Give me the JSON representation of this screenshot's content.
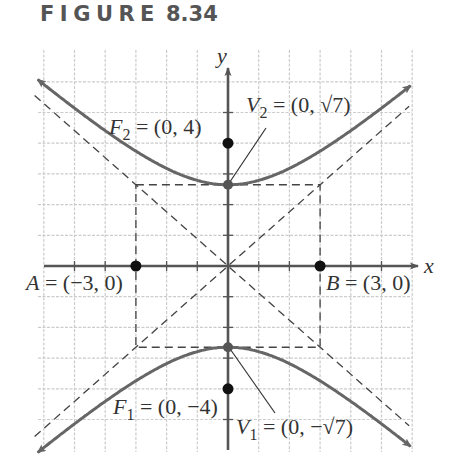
{
  "figure": {
    "title_word": "FIGURE",
    "title_number": "8.34"
  },
  "chart_data": {
    "type": "line",
    "xlabel": "x",
    "ylabel": "y",
    "xlim": [
      -6.3,
      6
    ],
    "ylim": [
      -6.5,
      6.5
    ],
    "grid": true,
    "grid_step": 1,
    "equation": "y^2/7 - x^2/9 = 1",
    "a": 2.6458,
    "b": 3,
    "c": 4,
    "series": [
      {
        "name": "upper branch",
        "style": "solid",
        "x": [
          -6,
          -5,
          -4,
          -3,
          -2,
          -1,
          0,
          1,
          2,
          3,
          4,
          5,
          6
        ],
        "y": [
          5.92,
          5.14,
          4.41,
          3.74,
          3.18,
          2.79,
          2.65,
          2.79,
          3.18,
          3.74,
          4.41,
          5.14,
          5.92
        ]
      },
      {
        "name": "lower branch",
        "style": "solid",
        "x": [
          -6,
          -5,
          -4,
          -3,
          -2,
          -1,
          0,
          1,
          2,
          3,
          4,
          5,
          6
        ],
        "y": [
          -5.92,
          -5.14,
          -4.41,
          -3.74,
          -3.18,
          -2.79,
          -2.65,
          -2.79,
          -3.18,
          -3.74,
          -4.41,
          -5.14,
          -5.92
        ]
      },
      {
        "name": "asymptote y = (sqrt7/3)x",
        "style": "dashed",
        "x": [
          -6,
          6
        ],
        "y": [
          -5.29,
          5.29
        ]
      },
      {
        "name": "asymptote y = -(sqrt7/3)x",
        "style": "dashed",
        "x": [
          -6,
          6
        ],
        "y": [
          5.29,
          -5.29
        ]
      },
      {
        "name": "fundamental rectangle",
        "style": "dashed",
        "x": [
          -3,
          3,
          3,
          -3,
          -3
        ],
        "y": [
          2.65,
          2.65,
          -2.65,
          -2.65,
          2.65
        ]
      }
    ],
    "points": [
      {
        "id": "F2",
        "label": "F",
        "sub": "2",
        "text": " = (0, 4)",
        "x": 0,
        "y": 4
      },
      {
        "id": "V2",
        "label": "V",
        "sub": "2",
        "text": " = (0, √7)",
        "x": 0,
        "y": 2.6458
      },
      {
        "id": "A",
        "label": "A",
        "sub": "",
        "text": " = (−3, 0)",
        "x": -3,
        "y": 0
      },
      {
        "id": "B",
        "label": "B",
        "sub": "",
        "text": " = (3, 0)",
        "x": 3,
        "y": 0
      },
      {
        "id": "V1",
        "label": "V",
        "sub": "1",
        "text": " = (0, −√7)",
        "x": 0,
        "y": -2.6458
      },
      {
        "id": "F1",
        "label": "F",
        "sub": "1",
        "text": " = (0, −4)",
        "x": 0,
        "y": -4
      }
    ]
  },
  "labels": {
    "x_axis": "x",
    "y_axis": "y",
    "F2": {
      "main": "F",
      "sub": "2",
      "rest": " = (0, 4)"
    },
    "V2": {
      "main": "V",
      "sub": "2",
      "rest": " = (0, √7)"
    },
    "A": {
      "main": "A",
      "rest": " = (−3, 0)"
    },
    "B": {
      "main": "B",
      "rest": " = (3, 0)"
    },
    "F1": {
      "main": "F",
      "sub": "1",
      "rest": " = (0, −4)"
    },
    "V1": {
      "main": "V",
      "sub": "1",
      "rest": " = (0, −√7)"
    }
  },
  "colors": {
    "grid": "#cccccc",
    "axis": "#555555",
    "curve": "#666666",
    "dash": "#444444",
    "point": "#111111",
    "text": "#333333"
  }
}
